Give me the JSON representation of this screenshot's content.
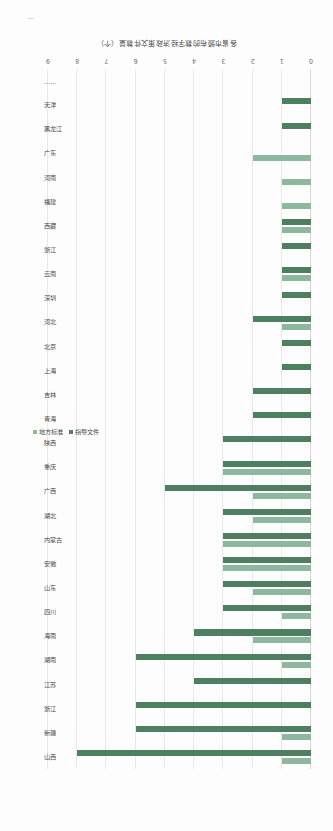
{
  "chart_data": {
    "type": "bar",
    "orientation": "horizontal",
    "title": "",
    "xlabel": "",
    "ylabel": "各省市颁布的数字经济政策文件数量（个）",
    "xlim": [
      0,
      9
    ],
    "grid": true,
    "legend_position": "right",
    "tick_labels": [
      "0",
      "1",
      "2",
      "3",
      "4",
      "5",
      "6",
      "7",
      "8",
      "9"
    ],
    "categories": [
      "山西",
      "新疆",
      "浙江",
      "江苏",
      "湖南",
      "海南",
      "四川",
      "山东",
      "安徽",
      "内蒙古",
      "湖北",
      "广西",
      "重庆",
      "陕西",
      "青海",
      "吉林",
      "上海",
      "北京",
      "河北",
      "深圳",
      "云南",
      "浙江",
      "西藏",
      "福建",
      "河南",
      "广东",
      "黑龙江",
      "天津",
      "……"
    ],
    "series": [
      {
        "name": "地方标准",
        "color": "#8EB89D",
        "values": [
          1,
          1,
          0,
          0,
          1,
          2,
          1,
          2,
          3,
          3,
          2,
          2,
          3,
          0,
          0,
          0,
          0,
          0,
          1,
          0,
          1,
          0,
          1,
          1,
          1,
          2,
          0,
          0,
          0
        ]
      },
      {
        "name": "指导文件",
        "color": "#4F7F61",
        "values": [
          8,
          6,
          6,
          4,
          6,
          4,
          3,
          3,
          3,
          3,
          3,
          5,
          3,
          3,
          2,
          2,
          1,
          1,
          2,
          1,
          1,
          1,
          1,
          0,
          0,
          0,
          1,
          1,
          0
        ]
      }
    ]
  },
  "legend": {
    "entries": [
      {
        "label": "地方标准",
        "color": "#8EB89D"
      },
      {
        "label": "指导文件",
        "color": "#4F7F61"
      }
    ]
  },
  "axis": {
    "value_axis_title": "各省市颁布的数字经济政策文件数量（个）"
  }
}
